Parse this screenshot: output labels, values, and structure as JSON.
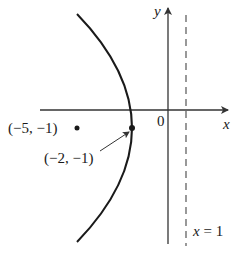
{
  "figure": {
    "type": "parabola with focus and directrix",
    "axes": {
      "x_label": "x",
      "y_label": "y",
      "origin_label": "0"
    },
    "directrix": {
      "label": "x = 1",
      "label_var": "x",
      "label_eq": "=",
      "label_val": "1",
      "style": "dashed"
    },
    "vertex": {
      "label": "(−2, −1)",
      "x": -2,
      "y": -1
    },
    "focus": {
      "label": "(−5, −1)",
      "x": -5,
      "y": -1
    },
    "colors": {
      "stroke": "#1a1a1a",
      "axis": "#333333",
      "background": "#ffffff"
    }
  }
}
